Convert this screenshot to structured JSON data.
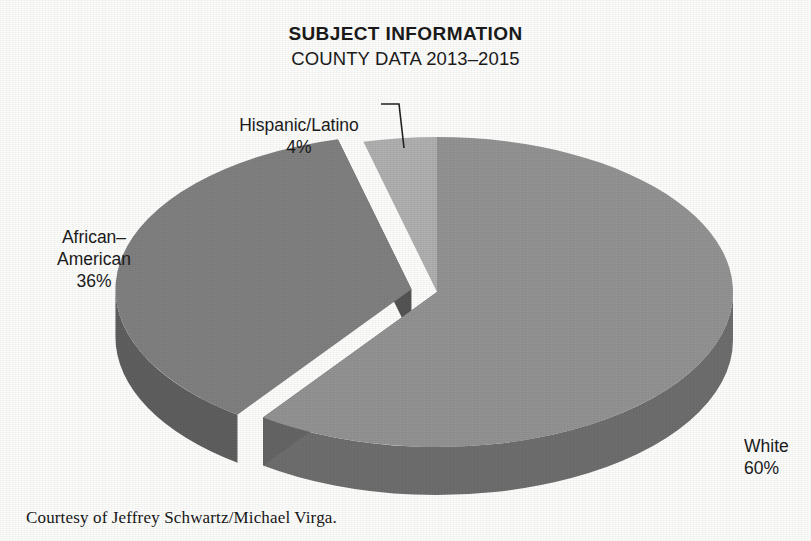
{
  "title": {
    "main": "SUBJECT INFORMATION",
    "sub": "COUNTY DATA 2013–2015"
  },
  "caption": "Courtesy of Jeffrey Schwartz/Michael Virga.",
  "labels": {
    "white": {
      "name": "White",
      "pct": "60%"
    },
    "african": {
      "name": "African–\nAmerican",
      "pct": "36%"
    },
    "hispanic": {
      "name": "Hispanic/Latino",
      "pct": "4%"
    }
  },
  "colors": {
    "background": "#fdfdfc",
    "text": "#1a1a1a",
    "white_top": "#939393",
    "white_side": "#6e6e6e",
    "african_top": "#808080",
    "african_side": "#5f5f5f",
    "hispanic_top": "#b0b0b0",
    "hispanic_side": "#8a8a8a",
    "leader_line": "#222222"
  },
  "chart_data": {
    "type": "pie",
    "title": "SUBJECT INFORMATION",
    "subtitle": "COUNTY DATA 2013–2015",
    "three_d": true,
    "start_angle_deg": 0,
    "direction": "clockwise",
    "labels": [
      "White",
      "African–American",
      "Hispanic/Latino"
    ],
    "values": [
      60,
      36,
      4
    ],
    "value_unit": "percent",
    "data_labels": [
      "60%",
      "36%",
      "4%"
    ],
    "exploded": [
      false,
      true,
      false
    ],
    "legend": "none",
    "label_placement": "outside-callout",
    "slice_colors": [
      "#939393",
      "#808080",
      "#b0b0b0"
    ]
  },
  "geometry": {
    "cx": 437,
    "cy": 292,
    "rx": 296,
    "ry": 155,
    "depth": 48,
    "explode_px": 26,
    "leader": {
      "x1": 381,
      "y1": 104,
      "x2": 399,
      "y2": 104,
      "x3": 404,
      "y3": 148
    }
  }
}
